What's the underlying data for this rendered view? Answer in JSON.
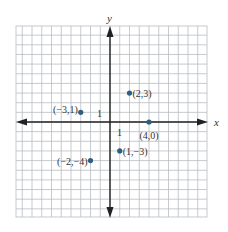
{
  "chart_data": {
    "type": "scatter",
    "title": "",
    "xlabel": "x",
    "ylabel": "y",
    "xlim": [
      -10,
      10
    ],
    "ylim": [
      -10,
      10
    ],
    "grid": true,
    "tick_labels": {
      "x_unit": "1",
      "y_unit": "1"
    },
    "points": [
      {
        "x": 2,
        "y": 3,
        "label": "(2,3)"
      },
      {
        "x": -3,
        "y": 1,
        "label": "(−3,1)"
      },
      {
        "x": 4,
        "y": 0,
        "label": "(4,0)"
      },
      {
        "x": 1,
        "y": -3,
        "label": "(1,−3)"
      },
      {
        "x": -2,
        "y": -4,
        "label": "(−2,−4)"
      }
    ],
    "colors": {
      "point": "#2b5f86",
      "grid": "#b9bcc2",
      "axis": "#222222"
    }
  }
}
